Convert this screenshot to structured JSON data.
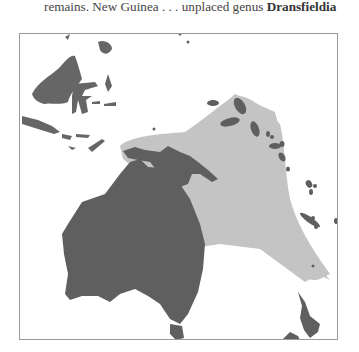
{
  "caption": {
    "prefix": "remains. New Guinea . . . unplaced genus ",
    "genus": "Dransfieldia"
  },
  "map": {
    "region": "Malesia and Australasia",
    "land_color": "#5f5f5f",
    "distribution_color": "#c4c4c4",
    "frame_color": "#9a9a9a",
    "landmasses": [
      "Borneo",
      "Sulawesi",
      "Sumatra/Java",
      "Lesser Sunda Islands",
      "New Guinea",
      "Solomon Islands",
      "Vanuatu",
      "New Caledonia",
      "Australia",
      "Tasmania",
      "New Zealand"
    ],
    "highlighted_range": "New Guinea to Solomon Islands, Vanuatu and New Caledonia"
  }
}
